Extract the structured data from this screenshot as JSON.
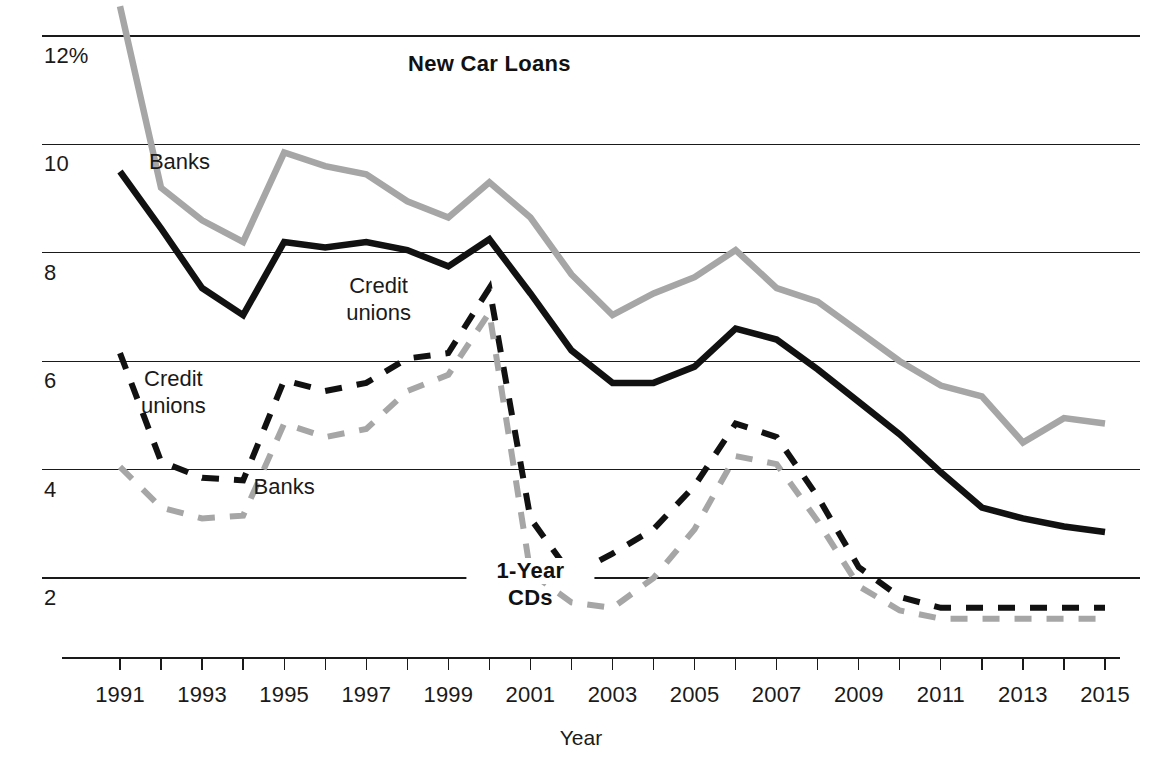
{
  "chart_data": {
    "type": "line",
    "title": "",
    "xlabel": "Year",
    "ylabel": "",
    "grid": true,
    "legend_position": "inline-annotations",
    "x": [
      1991,
      1992,
      1993,
      1994,
      1995,
      1996,
      1997,
      1998,
      1999,
      2000,
      2001,
      2002,
      2003,
      2004,
      2005,
      2006,
      2007,
      2008,
      2009,
      2010,
      2011,
      2012,
      2013,
      2014,
      2015
    ],
    "xlim": [
      1991,
      2015
    ],
    "ylim": [
      1.0,
      12.6
    ],
    "ytick_values": [
      12,
      10,
      8,
      6,
      4,
      2
    ],
    "ytick_labels": [
      "12%",
      "10",
      "8",
      "6",
      "4",
      "2"
    ],
    "xtick_labels": [
      "1991",
      "1993",
      "1995",
      "1997",
      "1999",
      "2001",
      "2003",
      "2005",
      "2007",
      "2009",
      "2011",
      "2013",
      "2015"
    ],
    "xtick_values": [
      1991,
      1993,
      1995,
      1997,
      1999,
      2001,
      2003,
      2005,
      2007,
      2009,
      2011,
      2013,
      2015
    ],
    "groups": [
      {
        "name": "New Car Loans",
        "label": "New Car Loans",
        "label_x": 2000.0,
        "label_y": 11.35
      },
      {
        "name": "1-Year CDs",
        "label": "1-Year CDs",
        "line1": "1-Year",
        "line2": "CDs",
        "label_x": 2001.0,
        "label_y": 2.0
      }
    ],
    "series": [
      {
        "name": "New Car Loans - Banks",
        "group": "New Car Loans",
        "style": "solid",
        "color": "#a6a6a6",
        "width": 6.5,
        "label": "Banks",
        "label_x": 1992.45,
        "label_y": 9.55,
        "values": [
          12.55,
          9.2,
          8.6,
          8.2,
          9.85,
          9.6,
          9.45,
          8.95,
          8.65,
          9.3,
          8.65,
          7.6,
          6.85,
          7.25,
          7.55,
          8.05,
          7.35,
          7.1,
          6.55,
          6.0,
          5.55,
          5.35,
          4.5,
          4.95,
          4.85
        ]
      },
      {
        "name": "New Car Loans - Credit unions",
        "group": "New Car Loans",
        "style": "solid",
        "color": "#111111",
        "width": 6.5,
        "label": "Credit unions",
        "line1": "Credit",
        "line2": "unions",
        "label_x": 1997.3,
        "label_y": 7.25,
        "values": [
          9.5,
          8.45,
          7.35,
          6.85,
          8.2,
          8.1,
          8.2,
          8.05,
          7.75,
          8.25,
          7.25,
          6.2,
          5.6,
          5.6,
          5.9,
          6.6,
          6.4,
          5.85,
          5.25,
          4.65,
          3.95,
          3.3,
          3.1,
          2.95,
          2.85
        ]
      },
      {
        "name": "1-Year CDs - Credit unions",
        "group": "1-Year CDs",
        "style": "dashed",
        "color": "#111111",
        "width": 6.0,
        "dash": "17,15",
        "label": "Credit unions",
        "line1": "Credit",
        "line2": "unions",
        "label_x": 1992.3,
        "label_y": 5.55,
        "values": [
          6.15,
          4.15,
          3.85,
          3.8,
          5.65,
          5.45,
          5.6,
          6.05,
          6.15,
          7.35,
          3.1,
          2.05,
          2.45,
          2.9,
          3.7,
          4.85,
          4.6,
          3.5,
          2.2,
          1.65,
          1.45,
          1.45,
          1.45,
          1.45,
          1.45
        ]
      },
      {
        "name": "1-Year CDs - Banks",
        "group": "1-Year CDs",
        "style": "dashed",
        "color": "#a6a6a6",
        "width": 6.0,
        "dash": "17,15",
        "label": "Banks",
        "label_x": 1995.0,
        "label_y": 3.55,
        "values": [
          4.05,
          3.3,
          3.1,
          3.15,
          4.85,
          4.6,
          4.75,
          5.45,
          5.75,
          6.9,
          2.1,
          1.55,
          1.45,
          2.0,
          2.9,
          4.25,
          4.1,
          3.05,
          1.85,
          1.4,
          1.25,
          1.25,
          1.25,
          1.25,
          1.25
        ]
      }
    ]
  },
  "colors": {
    "gray_series": "#a6a6a6",
    "black_series": "#111111",
    "axis": "#1a1a1a",
    "background": "#ffffff"
  }
}
